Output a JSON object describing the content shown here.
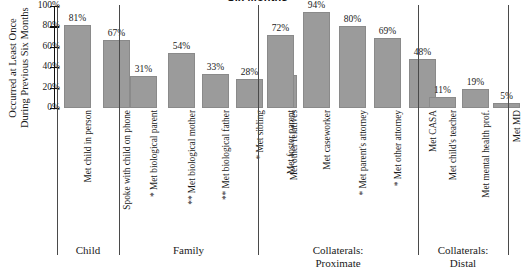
{
  "chart_data": {
    "type": "bar",
    "title": "Six Months",
    "xlabel": "",
    "ylabel_line1": "Occurred at Least Once",
    "ylabel_line2": "During Previous Six Months",
    "ylim": [
      0,
      100
    ],
    "yticks": [
      "0%",
      "20%",
      "40%",
      "60%",
      "80%",
      "100%"
    ],
    "ytick_values": [
      0,
      20,
      40,
      60,
      80,
      100
    ],
    "grid": false,
    "legend": "none",
    "value_suffix": "%",
    "bar_color": "#9b9b9b",
    "axis_color": "#111111",
    "categories": [
      "Met child in person",
      "Spoke with child on phone",
      "Met biological parent",
      "Met biological mother",
      "Met biological father",
      "Met sibling",
      "Met other relatives",
      "Met foster parent",
      "Met caseworker",
      "Met parent's attorney",
      "Met other attorney",
      "Met CASA",
      "Met child's teacher",
      "Met mental health prof.",
      "Met MD"
    ],
    "significance_marks": [
      "",
      "",
      "*",
      "**",
      "**",
      "*",
      "",
      "",
      "",
      "*",
      "*",
      "",
      "",
      "",
      ""
    ],
    "values": [
      81,
      67,
      31,
      54,
      33,
      28,
      32,
      72,
      94,
      80,
      69,
      48,
      11,
      19,
      5
    ],
    "value_labels": [
      "81%",
      "67%",
      "31%",
      "54%",
      "33%",
      "28%",
      "32%",
      "72%",
      "94%",
      "80%",
      "69%",
      "48%",
      "11%",
      "19%",
      "5%"
    ],
    "groups": [
      {
        "label_line1": "Child",
        "label_line2": "",
        "start": 0,
        "end": 1
      },
      {
        "label_line1": "Family",
        "label_line2": "",
        "start": 2,
        "end": 6
      },
      {
        "label_line1": "Collaterals:",
        "label_line2": "Proximate",
        "start": 7,
        "end": 11
      },
      {
        "label_line1": "Collaterals:",
        "label_line2": "Distal",
        "start": 12,
        "end": 14
      }
    ]
  }
}
